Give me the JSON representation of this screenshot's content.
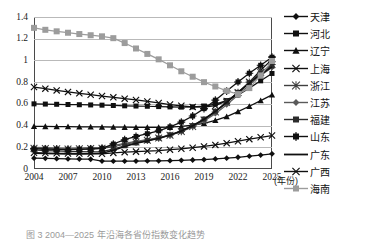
{
  "figure": {
    "caption": "图 3  2004—2025 年沿海各省份指数变化趋势",
    "x_axis_unit": "(年份)"
  },
  "chart_data": {
    "type": "line",
    "title": "",
    "xlabel": "(年份)",
    "ylabel": "",
    "xlim": [
      2004,
      2025
    ],
    "ylim": [
      0,
      1.4
    ],
    "ytick_labels": [
      "0",
      "0.2",
      "0.4",
      "0.6",
      "0.8",
      "1",
      "1.2",
      "1.4"
    ],
    "ytick_values": [
      0,
      0.2,
      0.4,
      0.6,
      0.8,
      1.0,
      1.2,
      1.4
    ],
    "xtick_labels": [
      "2004",
      "2007",
      "2010",
      "2013",
      "2016",
      "2019",
      "2022",
      "2025"
    ],
    "xtick_values": [
      2004,
      2007,
      2010,
      2013,
      2016,
      2019,
      2022,
      2025
    ],
    "x": [
      2004,
      2005,
      2006,
      2007,
      2008,
      2009,
      2010,
      2011,
      2012,
      2013,
      2014,
      2015,
      2016,
      2017,
      2018,
      2019,
      2020,
      2021,
      2022,
      2023,
      2024,
      2025
    ],
    "grid": true,
    "legend_position": "right",
    "series": [
      {
        "name": "天津",
        "marker": "diamond",
        "color": "#101010",
        "values": [
          0.1,
          0.098,
          0.095,
          0.093,
          0.092,
          0.09,
          0.073,
          0.072,
          0.072,
          0.073,
          0.074,
          0.075,
          0.077,
          0.08,
          0.083,
          0.087,
          0.093,
          0.1,
          0.108,
          0.118,
          0.128,
          0.14
        ]
      },
      {
        "name": "河北",
        "marker": "square",
        "color": "#101010",
        "values": [
          0.6,
          0.598,
          0.596,
          0.594,
          0.592,
          0.59,
          0.588,
          0.585,
          0.582,
          0.58,
          0.578,
          0.575,
          0.572,
          0.57,
          0.572,
          0.58,
          0.598,
          0.63,
          0.682,
          0.745,
          0.812,
          0.88
        ]
      },
      {
        "name": "辽宁",
        "marker": "triangle",
        "color": "#101010",
        "values": [
          0.393,
          0.392,
          0.391,
          0.39,
          0.389,
          0.388,
          0.387,
          0.386,
          0.385,
          0.384,
          0.383,
          0.383,
          0.385,
          0.392,
          0.404,
          0.421,
          0.448,
          0.483,
          0.528,
          0.578,
          0.63,
          0.683
        ]
      },
      {
        "name": "上海",
        "marker": "x",
        "color": "#101010",
        "values": [
          0.755,
          0.74,
          0.724,
          0.71,
          0.697,
          0.684,
          0.672,
          0.66,
          0.648,
          0.636,
          0.622,
          0.608,
          0.594,
          0.582,
          0.572,
          0.57,
          0.583,
          0.627,
          0.7,
          0.8,
          0.91,
          1.01
        ]
      },
      {
        "name": "浙江",
        "marker": "star",
        "color": "#3f3f3f",
        "values": [
          0.19,
          0.188,
          0.186,
          0.184,
          0.186,
          0.188,
          0.19,
          0.205,
          0.228,
          0.248,
          0.265,
          0.285,
          0.31,
          0.345,
          0.392,
          0.452,
          0.525,
          0.612,
          0.705,
          0.8,
          0.89,
          0.962
        ]
      },
      {
        "name": "江苏",
        "marker": "diamond",
        "color": "#5a5a5a",
        "values": [
          0.2,
          0.196,
          0.193,
          0.19,
          0.192,
          0.196,
          0.2,
          0.216,
          0.236,
          0.254,
          0.27,
          0.288,
          0.312,
          0.344,
          0.388,
          0.443,
          0.51,
          0.592,
          0.682,
          0.775,
          0.862,
          0.935
        ]
      },
      {
        "name": "福建",
        "marker": "square",
        "color": "#2b2b2b",
        "values": [
          0.175,
          0.17,
          0.166,
          0.162,
          0.16,
          0.158,
          0.16,
          0.184,
          0.214,
          0.24,
          0.262,
          0.285,
          0.315,
          0.352,
          0.4,
          0.46,
          0.532,
          0.616,
          0.706,
          0.796,
          0.878,
          0.948
        ]
      },
      {
        "name": "山东",
        "marker": "plus-square",
        "color": "#101010",
        "values": [
          0.185,
          0.182,
          0.18,
          0.178,
          0.18,
          0.184,
          0.19,
          0.23,
          0.27,
          0.3,
          0.325,
          0.352,
          0.388,
          0.432,
          0.488,
          0.556,
          0.634,
          0.718,
          0.802,
          0.882,
          0.955,
          1.03
        ]
      },
      {
        "name": "广东",
        "marker": "none",
        "color": "#101010",
        "values": [
          0.145,
          0.142,
          0.14,
          0.138,
          0.138,
          0.14,
          0.144,
          0.172,
          0.206,
          0.236,
          0.258,
          0.282,
          0.312,
          0.35,
          0.398,
          0.458,
          0.53,
          0.614,
          0.703,
          0.792,
          0.872,
          0.94
        ]
      },
      {
        "name": "广西",
        "marker": "x",
        "color": "#101010",
        "values": [
          0.15,
          0.147,
          0.145,
          0.143,
          0.142,
          0.141,
          0.14,
          0.148,
          0.155,
          0.16,
          0.165,
          0.17,
          0.178,
          0.186,
          0.196,
          0.208,
          0.222,
          0.238,
          0.256,
          0.275,
          0.292,
          0.308
        ]
      },
      {
        "name": "海南",
        "marker": "square",
        "color": "#9c9c9c",
        "values": [
          1.3,
          1.282,
          1.268,
          1.255,
          1.243,
          1.232,
          1.222,
          1.205,
          1.16,
          1.11,
          1.06,
          1.01,
          0.955,
          0.9,
          0.85,
          0.8,
          0.76,
          0.72,
          0.69,
          0.745,
          0.862,
          0.995
        ]
      }
    ]
  },
  "legend": {
    "items": [
      {
        "label": "天津",
        "marker": "diamond",
        "color": "#101010"
      },
      {
        "label": "河北",
        "marker": "square",
        "color": "#101010"
      },
      {
        "label": "辽宁",
        "marker": "triangle",
        "color": "#101010"
      },
      {
        "label": "上海",
        "marker": "x",
        "color": "#101010"
      },
      {
        "label": "浙江",
        "marker": "star",
        "color": "#3f3f3f"
      },
      {
        "label": "江苏",
        "marker": "diamond",
        "color": "#5a5a5a"
      },
      {
        "label": "福建",
        "marker": "square",
        "color": "#2b2b2b"
      },
      {
        "label": "山东",
        "marker": "plus-square",
        "color": "#101010"
      },
      {
        "label": "广东",
        "marker": "none",
        "color": "#101010"
      },
      {
        "label": "广西",
        "marker": "x",
        "color": "#101010"
      },
      {
        "label": "海南",
        "marker": "square",
        "color": "#9c9c9c"
      }
    ]
  }
}
